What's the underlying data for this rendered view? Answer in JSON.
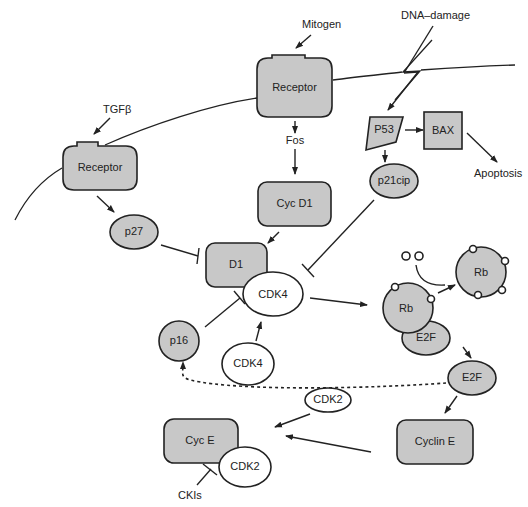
{
  "diagram": {
    "type": "signaling-pathway",
    "colors": {
      "node_fill": "#c8c8c8",
      "stroke": "#222222",
      "background": "#ffffff"
    },
    "labels": {
      "mitogen": "Mitogen",
      "dna_damage": "DNA–damage",
      "tgfb": "TGFβ",
      "fos": "Fos",
      "apoptosis": "Apoptosis",
      "ckis": "CKIs"
    },
    "nodes": {
      "receptor_top": "Receptor",
      "receptor_left": "Receptor",
      "p53": "P53",
      "bax": "BAX",
      "p21cip": "p21cip",
      "cyc_d1": "Cyc D1",
      "p27": "p27",
      "d1": "D1",
      "cdk4_bound": "CDK4",
      "cdk4_free": "CDK4",
      "p16": "p16",
      "rb_bound": "Rb",
      "e2f_bound": "E2F",
      "rb_phospho": "Rb",
      "e2f_free": "E2F",
      "cdk2_free": "CDK2",
      "cyc_e": "Cyc E",
      "cdk2_bound": "CDK2",
      "cyclin_e": "Cyclin E"
    },
    "edges": [
      {
        "from": "Mitogen",
        "to": "Receptor (top)",
        "type": "activate"
      },
      {
        "from": "TGFβ",
        "to": "Receptor (left)",
        "type": "activate"
      },
      {
        "from": "DNA–damage",
        "to": "P53",
        "type": "activate"
      },
      {
        "from": "Receptor (top)",
        "to": "Fos",
        "type": "activate"
      },
      {
        "from": "Fos",
        "to": "Cyc D1",
        "type": "activate"
      },
      {
        "from": "Cyc D1",
        "to": "D1",
        "type": "activate"
      },
      {
        "from": "P53",
        "to": "BAX",
        "type": "activate"
      },
      {
        "from": "BAX",
        "to": "Apoptosis",
        "type": "activate"
      },
      {
        "from": "P53",
        "to": "p21cip",
        "type": "activate"
      },
      {
        "from": "p21cip",
        "to": "D1/CDK4",
        "type": "inhibit"
      },
      {
        "from": "Receptor (left)",
        "to": "p27",
        "type": "activate"
      },
      {
        "from": "p27",
        "to": "D1",
        "type": "inhibit"
      },
      {
        "from": "p16",
        "to": "D1/CDK4",
        "type": "inhibit"
      },
      {
        "from": "CDK4",
        "to": "CDK4 (bound)",
        "type": "activate"
      },
      {
        "from": "D1/CDK4",
        "to": "Rb/E2F",
        "type": "activate"
      },
      {
        "from": "Rb/E2F",
        "to": "Rb (phosphorylated)",
        "type": "activate"
      },
      {
        "from": "Rb/E2F",
        "to": "E2F",
        "type": "activate"
      },
      {
        "from": "E2F",
        "to": "p16",
        "type": "feedback-dashed"
      },
      {
        "from": "E2F",
        "to": "Cyclin E",
        "type": "activate"
      },
      {
        "from": "Cyclin E",
        "to": "Cyc E/CDK2",
        "type": "activate"
      },
      {
        "from": "CDK2",
        "to": "Cyc E/CDK2",
        "type": "activate"
      },
      {
        "from": "CKIs",
        "to": "Cyc E/CDK2",
        "type": "inhibit"
      }
    ]
  }
}
